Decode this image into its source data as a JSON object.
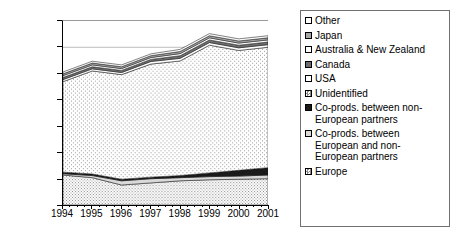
{
  "chart_data": {
    "type": "area",
    "stacked": true,
    "title": "",
    "subtitle": "",
    "xlabel": "",
    "ylabel": "",
    "x": [
      1994,
      1995,
      1996,
      1997,
      1998,
      1999,
      2000,
      2001
    ],
    "categories": [
      "1994",
      "1995",
      "1996",
      "1997",
      "1998",
      "1999",
      "2000",
      "2001"
    ],
    "xtick_labels": [
      "1994",
      "1995",
      "1996",
      "1997",
      "1998",
      "1999",
      "2000",
      "2001"
    ],
    "ytick_labels": [
      "0",
      "50 000",
      "100 000",
      "150 000",
      "200 000",
      "250 000",
      "300 000",
      "350 000"
    ],
    "ytick_values": [
      0,
      50000,
      100000,
      150000,
      200000,
      250000,
      300000,
      350000
    ],
    "ylim": [
      0,
      350000
    ],
    "xlim": [
      1994,
      2001
    ],
    "grid": "horizontal-at-300000",
    "legend_position": "right-outside",
    "stack_order_bottom_to_top": [
      "Europe",
      "Co-prods. between European and non-European partners",
      "Co-prods. between non-European partners",
      "Unidentified",
      "USA",
      "Canada",
      "Australia & New Zealand",
      "Japan",
      "Other"
    ],
    "series": [
      {
        "name": "Europe",
        "fill": "fine-dots",
        "values": [
          57000,
          52000,
          38000,
          42000,
          46000,
          48000,
          49000,
          50000
        ]
      },
      {
        "name": "Co-prods. between European and non-European partners",
        "fill": "light-gray",
        "values": [
          2500,
          4000,
          8000,
          8000,
          6000,
          6000,
          6000,
          7000
        ]
      },
      {
        "name": "Co-prods. between non-European partners",
        "fill": "black",
        "values": [
          3000,
          3000,
          3000,
          3000,
          4000,
          7000,
          11000,
          14000
        ]
      },
      {
        "name": "Unidentified",
        "fill": "medium-dots",
        "values": [
          172000,
          196000,
          199000,
          215000,
          218000,
          243000,
          228000,
          229000
        ]
      },
      {
        "name": "USA",
        "fill": "white",
        "values": [
          4000,
          4000,
          4000,
          5000,
          5000,
          5000,
          5000,
          5000
        ]
      },
      {
        "name": "Canada",
        "fill": "dark-gray",
        "values": [
          4000,
          4000,
          4000,
          4000,
          5000,
          5000,
          5000,
          5000
        ]
      },
      {
        "name": "Australia & New Zealand",
        "fill": "white",
        "values": [
          3500,
          3500,
          3500,
          3500,
          4000,
          4000,
          4000,
          4000
        ]
      },
      {
        "name": "Japan",
        "fill": "medium-gray",
        "values": [
          3500,
          3500,
          3500,
          3500,
          4000,
          4000,
          4000,
          4000
        ]
      },
      {
        "name": "Other",
        "fill": "white",
        "values": [
          3500,
          3500,
          3500,
          3500,
          4000,
          4000,
          4000,
          4000
        ]
      }
    ],
    "totals": [
      253000,
      273500,
      266500,
      287500,
      296000,
      326000,
      316000,
      322000
    ]
  },
  "legend": {
    "items": [
      {
        "label": "Other",
        "fill": "white"
      },
      {
        "label": "Japan",
        "fill": "medium-gray"
      },
      {
        "label": "Australia & New Zealand",
        "fill": "white"
      },
      {
        "label": "Canada",
        "fill": "dark-gray"
      },
      {
        "label": "USA",
        "fill": "white"
      },
      {
        "label": "Unidentified",
        "fill": "light-dots"
      },
      {
        "label": "Co-prods. between non-\nEuropean partners",
        "fill": "black"
      },
      {
        "label": "Co-prods. between\nEuropean and non-\nEuropean partners",
        "fill": "light-gray"
      },
      {
        "label": "Europe",
        "fill": "fine-dots"
      }
    ]
  },
  "colors": {
    "white": "#ffffff",
    "light_gray": "#d9d9d9",
    "medium_gray": "#a6a6a6",
    "dark_gray": "#6e6e6e",
    "black": "#1a1a1a",
    "axis": "#000000",
    "gridline": "#a0a0a0",
    "legend_border": "#707070"
  }
}
